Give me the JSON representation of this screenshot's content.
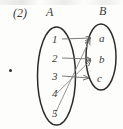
{
  "figure": {
    "item_number": "(2)",
    "bullet_marker": "•",
    "sets": {
      "left": {
        "name": "A",
        "elements": [
          "1",
          "2",
          "3",
          "4",
          "5"
        ]
      },
      "right": {
        "name": "B",
        "elements": [
          "a",
          "b",
          "c"
        ]
      }
    },
    "mappings": [
      {
        "from": "1",
        "to": "a",
        "style": "straight"
      },
      {
        "from": "2",
        "to": "b",
        "style": "straight"
      },
      {
        "from": "3",
        "to": "c",
        "style": "straight"
      },
      {
        "from": "4",
        "to": "b",
        "style": "diagonal"
      },
      {
        "from": "5",
        "to": "a",
        "style": "diagonal"
      }
    ],
    "colors": {
      "ink": "#3a3a3a",
      "ellipse_stroke": "#2b2b2b",
      "arrow_stroke": "#6e6e6e",
      "background": "#fdfdfc"
    }
  }
}
